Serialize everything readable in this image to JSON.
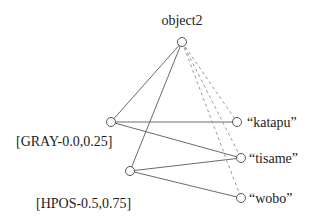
{
  "diagram": {
    "root": {
      "id": "object2",
      "label": "object2",
      "x": 182,
      "y": 42
    },
    "middle_nodes": [
      {
        "id": "gray",
        "label": "[GRAY-0.0,0.25]",
        "x": 111,
        "y": 122
      },
      {
        "id": "hpos",
        "label": "[HPOS-0.5,0.75]",
        "x": 130,
        "y": 171
      }
    ],
    "leaf_nodes": [
      {
        "id": "katapu",
        "label": "“katapu”",
        "x": 237,
        "y": 122
      },
      {
        "id": "tisame",
        "label": "“tisame”",
        "x": 241,
        "y": 158
      },
      {
        "id": "wobo",
        "label": "“wobo”",
        "x": 241,
        "y": 198
      }
    ],
    "edges_solid": [
      [
        "object2",
        "gray"
      ],
      [
        "object2",
        "hpos"
      ],
      [
        "gray",
        "katapu"
      ],
      [
        "gray",
        "tisame"
      ],
      [
        "hpos",
        "tisame"
      ],
      [
        "hpos",
        "wobo"
      ]
    ],
    "edges_dashed": [
      [
        "object2",
        "katapu"
      ],
      [
        "object2",
        "tisame"
      ],
      [
        "object2",
        "wobo"
      ]
    ]
  }
}
